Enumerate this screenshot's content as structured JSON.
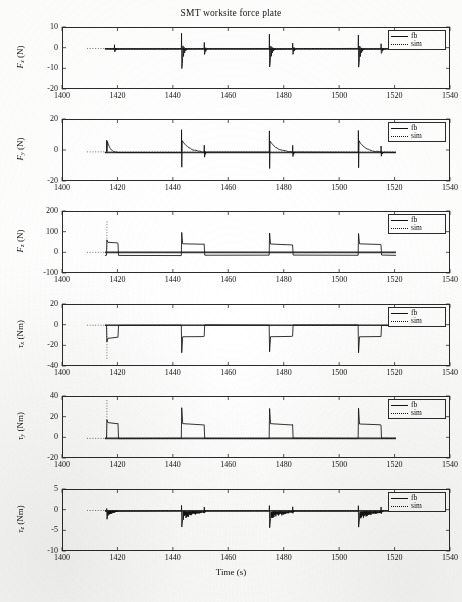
{
  "figure": {
    "title": "SMT worksite force plate",
    "xlabel": "Time (s)",
    "width": 462,
    "height": 602
  },
  "legend": {
    "entries": [
      {
        "label": "fb",
        "style": "solid"
      },
      {
        "label": "sim",
        "style": "dotted"
      }
    ],
    "position": "top-right"
  },
  "axis": {
    "xticks": [
      1400,
      1420,
      1440,
      1460,
      1480,
      1500,
      1520,
      1540
    ],
    "xticklabels": [
      "1400",
      "1420",
      "1440",
      "1460",
      "1480",
      "1500",
      "1520",
      "1540"
    ],
    "xlim": [
      1400,
      1540
    ]
  },
  "chart_data": [
    {
      "type": "line",
      "panel": 1,
      "title": "SMT worksite force plate",
      "xlabel": "",
      "ylabel": "F_x (N)",
      "ylabel_base": "F",
      "ylabel_sub": "x",
      "ylabel_unit": "(N)",
      "ylim": [
        -20,
        10
      ],
      "yticks": [
        10,
        0,
        -10,
        -20
      ],
      "yticklabels": [
        "10",
        "0",
        "-10",
        "-20"
      ],
      "xlim": [
        1400,
        1540
      ],
      "grid": false,
      "series": [
        {
          "name": "fb",
          "style": "solid",
          "baseline": -0.6,
          "data_start": 1415.5,
          "data_end": 1520.5,
          "events": [
            {
              "t": 1419.0,
              "up": 1.4,
              "down": -2.0,
              "decay": 1.2,
              "settle": -0.6
            },
            {
              "t": 1443.2,
              "up": 7.0,
              "down": -10.0,
              "decay": 2.0,
              "settle": -0.7
            },
            {
              "t": 1451.4,
              "up": 2.6,
              "down": -3.4,
              "decay": 1.5,
              "settle": -0.5
            },
            {
              "t": 1474.9,
              "up": 6.6,
              "down": -9.4,
              "decay": 2.0,
              "settle": -0.7
            },
            {
              "t": 1483.3,
              "up": 2.4,
              "down": -3.1,
              "decay": 1.5,
              "settle": -0.5
            },
            {
              "t": 1507.0,
              "up": 6.3,
              "down": -9.6,
              "decay": 2.0,
              "settle": -0.8
            },
            {
              "t": 1515.2,
              "up": 2.0,
              "down": -2.8,
              "decay": 1.6,
              "settle": -0.6
            }
          ]
        },
        {
          "name": "sim",
          "style": "dotted",
          "baseline": -0.4,
          "data_start": 1409.0,
          "data_end": 1520.5
        }
      ]
    },
    {
      "type": "line",
      "panel": 2,
      "ylabel": "F_y (N)",
      "ylabel_base": "F",
      "ylabel_sub": "y",
      "ylabel_unit": "(N)",
      "ylim": [
        -20,
        20
      ],
      "yticks": [
        20,
        0,
        -20
      ],
      "yticklabels": [
        "20",
        "0",
        "-20"
      ],
      "xlim": [
        1400,
        1540
      ],
      "grid": false,
      "series": [
        {
          "name": "fb",
          "style": "solid",
          "baseline": -1.6,
          "data_start": 1415.5,
          "data_end": 1520.5,
          "events": [
            {
              "t": 1416.2,
              "up": 6.5,
              "down": -1.0,
              "hold": 5.4,
              "hold_end": 1419.8,
              "settle": -1.8
            },
            {
              "t": 1443.2,
              "up": 13.0,
              "down": -11.0,
              "hold": 6.2,
              "hold_end": 1451.2,
              "settle": -1.6
            },
            {
              "t": 1451.4,
              "up": 3.2,
              "down": -4.6,
              "settle": -1.5
            },
            {
              "t": 1474.9,
              "up": 12.4,
              "down": -12.0,
              "hold": 5.6,
              "hold_end": 1483.1,
              "settle": -1.6
            },
            {
              "t": 1483.3,
              "up": 2.8,
              "down": -4.2,
              "settle": -1.5
            },
            {
              "t": 1507.0,
              "up": 12.6,
              "down": -11.6,
              "hold": 5.8,
              "hold_end": 1515.0,
              "settle": -1.6
            },
            {
              "t": 1515.2,
              "up": 2.6,
              "down": -3.8,
              "settle": -1.5
            }
          ]
        },
        {
          "name": "sim",
          "style": "dotted",
          "baseline": -1.2,
          "data_start": 1409.0,
          "data_end": 1520.5
        }
      ]
    },
    {
      "type": "line",
      "panel": 3,
      "ylabel": "F_z (N)",
      "ylabel_base": "F",
      "ylabel_sub": "z",
      "ylabel_unit": "(N)",
      "ylim": [
        -100,
        200
      ],
      "yticks": [
        200,
        100,
        0,
        -100
      ],
      "yticklabels": [
        "200",
        "100",
        "0",
        "-100"
      ],
      "xlim": [
        1400,
        1540
      ],
      "grid": false,
      "series": [
        {
          "name": "fb",
          "style": "solid",
          "baseline": 0,
          "data_start": 1415.5,
          "data_end": 1520.5,
          "pulses": [
            {
              "rise": 1416.2,
              "fall": 1420.2,
              "level": 48,
              "overshoot": 62
            },
            {
              "rise": 1443.2,
              "fall": 1451.3,
              "level": 42,
              "overshoot": 96
            },
            {
              "rise": 1474.9,
              "fall": 1483.2,
              "level": 40,
              "overshoot": 92
            },
            {
              "rise": 1507.0,
              "fall": 1515.1,
              "level": 40,
              "overshoot": 90
            }
          ],
          "low_level": -14
        },
        {
          "name": "sim",
          "style": "dotted",
          "baseline": 0,
          "data_start": 1409.0,
          "data_end": 1520.5,
          "spike_t": 1416.2,
          "spike_top": 150
        }
      ]
    },
    {
      "type": "line",
      "panel": 4,
      "ylabel": "tau_x (Nm)",
      "ylabel_base": "τ",
      "ylabel_sub": "x",
      "ylabel_unit": "(Nm)",
      "ylim": [
        -40,
        20
      ],
      "yticks": [
        20,
        0,
        -20,
        -40
      ],
      "yticklabels": [
        "20",
        "0",
        "-20",
        "-40"
      ],
      "xlim": [
        1400,
        1540
      ],
      "grid": false,
      "series": [
        {
          "name": "fb",
          "style": "solid",
          "baseline": -0.5,
          "data_start": 1415.5,
          "data_end": 1520.5,
          "pulses": [
            {
              "rise": 1416.2,
              "fall": 1420.2,
              "level": -13,
              "undershoot": -17
            },
            {
              "rise": 1443.2,
              "fall": 1451.3,
              "level": -12,
              "undershoot": -27
            },
            {
              "rise": 1474.9,
              "fall": 1483.2,
              "level": -12,
              "undershoot": -26
            },
            {
              "rise": 1507.0,
              "fall": 1515.1,
              "level": -12,
              "undershoot": -27
            }
          ],
          "high_level": -0.5
        },
        {
          "name": "sim",
          "style": "dotted",
          "baseline": -0.5,
          "data_start": 1409.0,
          "data_end": 1520.5,
          "spike_t": 1416.2,
          "spike_bottom": -33
        }
      ]
    },
    {
      "type": "line",
      "panel": 5,
      "ylabel": "tau_y (Nm)",
      "ylabel_base": "τ",
      "ylabel_sub": "y",
      "ylabel_unit": "(Nm)",
      "ylim": [
        -20,
        40
      ],
      "yticks": [
        40,
        20,
        0,
        -20
      ],
      "yticklabels": [
        "40",
        "20",
        "0",
        "-20"
      ],
      "xlim": [
        1400,
        1540
      ],
      "grid": false,
      "series": [
        {
          "name": "fb",
          "style": "solid",
          "baseline": -1.0,
          "data_start": 1415.5,
          "data_end": 1520.5,
          "pulses": [
            {
              "rise": 1416.2,
              "fall": 1420.2,
              "level": 14,
              "overshoot": 17
            },
            {
              "rise": 1443.2,
              "fall": 1451.3,
              "level": 13,
              "overshoot": 29
            },
            {
              "rise": 1474.9,
              "fall": 1483.2,
              "level": 13,
              "overshoot": 28
            },
            {
              "rise": 1507.0,
              "fall": 1515.1,
              "level": 13,
              "overshoot": 28
            }
          ],
          "low_level": -1.0
        },
        {
          "name": "sim",
          "style": "dotted",
          "baseline": -1.0,
          "data_start": 1409.0,
          "data_end": 1520.5,
          "spike_t": 1416.2,
          "spike_top": 36
        }
      ]
    },
    {
      "type": "line",
      "panel": 6,
      "ylabel": "tau_z (Nm)",
      "ylabel_base": "τ",
      "ylabel_sub": "z",
      "ylabel_unit": "(Nm)",
      "ylim": [
        -10,
        5
      ],
      "yticks": [
        5,
        0,
        -5,
        -10
      ],
      "yticklabels": [
        "5",
        "0",
        "-5",
        "-10"
      ],
      "xlim": [
        1400,
        1540
      ],
      "grid": false,
      "series": [
        {
          "name": "fb",
          "style": "solid",
          "baseline": -0.3,
          "data_start": 1415.5,
          "data_end": 1520.5,
          "events": [
            {
              "t": 1416.2,
              "up": 0.3,
              "down": -2.3,
              "band": 1.4,
              "band_end": 1419.9,
              "settle": -0.3
            },
            {
              "t": 1443.2,
              "up": 1.0,
              "down": -4.2,
              "band": 2.2,
              "band_end": 1451.2,
              "settle": -0.4
            },
            {
              "t": 1451.4,
              "up": 0.6,
              "down": -0.9,
              "settle": -0.3
            },
            {
              "t": 1474.9,
              "up": 1.0,
              "down": -4.4,
              "band": 2.1,
              "band_end": 1483.1,
              "settle": -0.4
            },
            {
              "t": 1483.3,
              "up": 0.6,
              "down": -0.9,
              "settle": -0.3
            },
            {
              "t": 1507.0,
              "up": 1.0,
              "down": -4.2,
              "band": 2.2,
              "band_end": 1515.0,
              "settle": -0.4
            },
            {
              "t": 1515.2,
              "up": 0.6,
              "down": -0.9,
              "settle": -0.3
            }
          ]
        },
        {
          "name": "sim",
          "style": "dotted",
          "baseline": -0.2,
          "data_start": 1409.0,
          "data_end": 1520.5
        }
      ]
    }
  ]
}
